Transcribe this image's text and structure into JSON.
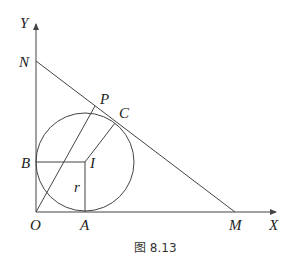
{
  "figure": {
    "caption": "图 8.13",
    "axes": {
      "x_label": "X",
      "y_label": "Y"
    },
    "points": {
      "O": "O",
      "N": "N",
      "M": "M",
      "A": "A",
      "B": "B",
      "C": "C",
      "P": "P",
      "I": "I"
    },
    "radius_label": "r",
    "colors": {
      "stroke": "#444444",
      "text": "#222222",
      "background": "#ffffff"
    }
  }
}
